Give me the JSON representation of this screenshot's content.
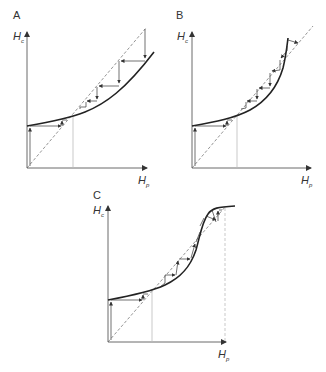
{
  "figure": {
    "panels": [
      {
        "label": "A",
        "y_axis": {
          "label": "H",
          "subscript": "c"
        },
        "x_axis": {
          "label": "H",
          "subscript": "p"
        },
        "description": "Convex increasing curve crossing the diagonal; cobweb converging to stable fixed point"
      },
      {
        "label": "B",
        "y_axis": {
          "label": "H",
          "subscript": "c"
        },
        "x_axis": {
          "label": "H",
          "subscript": "p"
        },
        "description": "Steeply rising curve crossing the diagonal twice; cobweb steps between crossings"
      },
      {
        "label": "C",
        "y_axis": {
          "label": "H",
          "subscript": "c"
        },
        "x_axis": {
          "label": "H",
          "subscript": "p"
        },
        "description": "Sigmoid curve crossing the diagonal three times; cobweb steps toward upper plateau"
      }
    ],
    "colors": {
      "curve": "#222222",
      "axis": "#444444",
      "diagonal": "#666666",
      "guide": "#bbbbbb",
      "cobweb": "#333333"
    }
  }
}
